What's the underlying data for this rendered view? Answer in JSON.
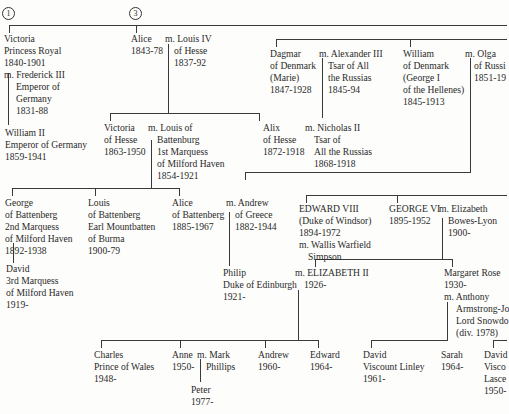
{
  "markers": {
    "m1": "1",
    "m3": "3"
  },
  "people": {
    "victoria_pr": [
      "Victoria",
      "Princess Royal",
      "1840-1901",
      "m. Frederick III",
      "Emperor of",
      "Germany",
      "1831-88"
    ],
    "alice": [
      "Alice",
      "1843-78"
    ],
    "louis_iv": [
      "m. Louis IV",
      "of Hesse",
      "1837-92"
    ],
    "dagmar": [
      "Dagmar",
      "of Denmark",
      "(Marie)",
      "1847-1928"
    ],
    "alexander_iii": [
      "m. Alexander III",
      "Tsar of All",
      "the Russias",
      "1845-94"
    ],
    "william_denmark": [
      "William",
      "of Denmark",
      "(George I",
      "of the Hellenes)",
      "1845-1913"
    ],
    "olga": [
      "m. Olga",
      "of Russi",
      "1851-19"
    ],
    "william_ii": [
      "William II",
      "Emperor of Germany",
      "1859-1941"
    ],
    "victoria_hesse": [
      "Victoria",
      "of Hesse",
      "1863-1950"
    ],
    "louis_battenberg": [
      "m. Louis of",
      "Battenburg",
      "1st Marquess",
      "of Milford Haven",
      "1854-1921"
    ],
    "alix": [
      "Alix",
      "of Hesse",
      "1872-1918"
    ],
    "nicholas_ii": [
      "m. Nicholas II",
      "Tsar of",
      "All the Russias",
      "1868-1918"
    ],
    "george_battenberg": [
      "George",
      "of Battenberg",
      "2nd Marquess",
      "of Milford Haven",
      "1892-1938"
    ],
    "louis_mountbatten": [
      "Louis",
      "of Battenberg",
      "Earl Mountbatten",
      "of Burma",
      "1900-79"
    ],
    "alice_battenberg": [
      "Alice",
      "of Battenberg",
      "1885-1967"
    ],
    "andrew_greece": [
      "m. Andrew",
      "of Greece",
      "1882-1944"
    ],
    "edward_viii": [
      "EDWARD VIII",
      "(Duke of Windsor)",
      "1894-1972",
      "m. Wallis Warfield",
      "Simpson"
    ],
    "george_vi": [
      "GEORGE VI",
      "1895-1952"
    ],
    "elizabeth_bl": [
      "m. Elizabeth",
      "Bowes-Lyon",
      "1900-"
    ],
    "david_milford": [
      "David",
      "3rd Marquess",
      "of Milford Haven",
      "1919-"
    ],
    "philip": [
      "Philip",
      "Duke of Edinburgh",
      "1921-"
    ],
    "elizabeth_ii": [
      "m. ELIZABETH II",
      "1926-"
    ],
    "margaret": [
      "Margaret Rose",
      "1930-",
      "m. Anthony",
      "Armstrong-Jo",
      "Lord Snowdo",
      "(div. 1978)"
    ],
    "charles": [
      "Charles",
      "Prince of Wales",
      "1948-"
    ],
    "anne": [
      "Anne",
      "1950-"
    ],
    "mark_phillips": [
      "m. Mark",
      "Phillips"
    ],
    "andrew": [
      "Andrew",
      "1960-"
    ],
    "edward": [
      "Edward",
      "1964-"
    ],
    "peter": [
      "Peter",
      "1977-"
    ],
    "david_linley": [
      "David",
      "Viscount Linley",
      "1961-"
    ],
    "sarah": [
      "Sarah",
      "1964-"
    ],
    "david_lascelles": [
      "David",
      "Visco",
      "Lasce",
      "1950-"
    ]
  }
}
